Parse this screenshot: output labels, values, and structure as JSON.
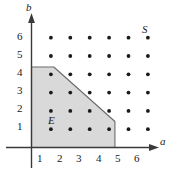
{
  "figure": {
    "type": "scatter-region-plot",
    "axis_x_label": "a",
    "axis_y_label": "b",
    "region_label": "E",
    "sample_space_label": "S",
    "background_color": "#ffffff",
    "dot_color": "#1a1a1a",
    "axis_color": "#3a3a3a",
    "region_fill": "#d9d9d9",
    "region_stroke": "#6b6b6b"
  },
  "chart_data": {
    "type": "scatter",
    "title": "",
    "xlabel": "a",
    "ylabel": "b",
    "xlim": [
      0,
      6.8
    ],
    "ylim": [
      0,
      6.8
    ],
    "grid": false,
    "xticks": [
      1,
      2,
      3,
      4,
      5,
      6
    ],
    "yticks": [
      1,
      2,
      3,
      4,
      5,
      6
    ],
    "xtick_labels": [
      "1",
      "2",
      "3",
      "4",
      "5",
      "6"
    ],
    "ytick_labels": [
      "1",
      "2",
      "3",
      "4",
      "5",
      "6"
    ],
    "legend": [],
    "series": [
      {
        "name": "S",
        "marker": "dot",
        "points": [
          [
            1,
            1
          ],
          [
            2,
            1
          ],
          [
            3,
            1
          ],
          [
            4,
            1
          ],
          [
            5,
            1
          ],
          [
            6,
            1
          ],
          [
            1,
            2
          ],
          [
            2,
            2
          ],
          [
            3,
            2
          ],
          [
            4,
            2
          ],
          [
            5,
            2
          ],
          [
            6,
            2
          ],
          [
            1,
            3
          ],
          [
            2,
            3
          ],
          [
            3,
            3
          ],
          [
            4,
            3
          ],
          [
            5,
            3
          ],
          [
            6,
            3
          ],
          [
            1,
            4
          ],
          [
            2,
            4
          ],
          [
            3,
            4
          ],
          [
            4,
            4
          ],
          [
            5,
            4
          ],
          [
            6,
            4
          ],
          [
            1,
            5
          ],
          [
            2,
            5
          ],
          [
            3,
            5
          ],
          [
            4,
            5
          ],
          [
            5,
            5
          ],
          [
            6,
            5
          ],
          [
            1,
            6
          ],
          [
            2,
            6
          ],
          [
            3,
            6
          ],
          [
            4,
            6
          ],
          [
            5,
            6
          ],
          [
            6,
            6
          ]
        ]
      }
    ],
    "annotations": [
      {
        "text": "S",
        "x": 6.05,
        "y": 6.45,
        "style": "italic"
      },
      {
        "text": "E",
        "x": 1.55,
        "y": 1.65,
        "style": "italic"
      },
      {
        "text": "a",
        "x": 6.75,
        "y": 0.35,
        "style": "italic"
      },
      {
        "text": "b",
        "x": 0.25,
        "y": 6.85,
        "style": "italic"
      }
    ],
    "shaded_region": {
      "label": "E",
      "fill": "#d9d9d9",
      "stroke": "#6b6b6b",
      "stroke_style": "solid",
      "vertices": [
        [
          0.0,
          0.0
        ],
        [
          0.0,
          4.4
        ],
        [
          1.15,
          4.4
        ],
        [
          4.3,
          1.42
        ],
        [
          4.3,
          0.0
        ]
      ]
    }
  },
  "ticks": {
    "x": [
      {
        "value": "1",
        "left": 37,
        "top": 153
      },
      {
        "value": "2",
        "left": 57,
        "top": 153
      },
      {
        "value": "3",
        "left": 76,
        "top": 153
      },
      {
        "value": "4",
        "left": 96,
        "top": 153
      },
      {
        "value": "5",
        "left": 115,
        "top": 153
      },
      {
        "value": "6",
        "left": 134,
        "top": 153
      }
    ],
    "y": [
      {
        "value": "6",
        "left": 17,
        "top": 31
      },
      {
        "value": "5",
        "left": 17,
        "top": 49
      },
      {
        "value": "4",
        "left": 17,
        "top": 67
      },
      {
        "value": "3",
        "left": 17,
        "top": 85
      },
      {
        "value": "2",
        "left": 17,
        "top": 103
      },
      {
        "value": "1",
        "left": 17,
        "top": 121
      }
    ]
  },
  "labels": {
    "y_axis_name": {
      "text": "b",
      "left": 26,
      "top": 2
    },
    "x_axis_name": {
      "text": "a",
      "left": 160,
      "top": 136
    },
    "set_s": {
      "text": "S",
      "left": 142,
      "top": 24
    },
    "set_e": {
      "text": "E",
      "left": 48,
      "top": 115
    }
  }
}
